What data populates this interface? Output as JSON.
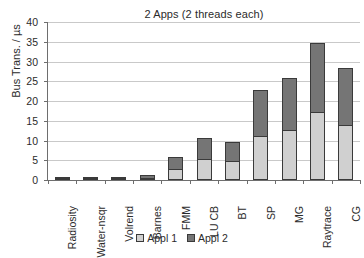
{
  "chart_data": {
    "type": "bar",
    "stacked": true,
    "title": "2 Apps (2 threads each)",
    "xlabel": "",
    "ylabel": "Bus Trans. / µs",
    "ylim": [
      0,
      40
    ],
    "ytick_step": 5,
    "yticks": [
      0,
      5,
      10,
      15,
      20,
      25,
      30,
      35,
      40
    ],
    "ytick_labels": [
      "0",
      "5",
      "10",
      "15",
      "20",
      "25",
      "30",
      "35",
      "40"
    ],
    "grid": true,
    "legend_position": "bottom",
    "categories": [
      "Radiosity",
      "Water-nsqr",
      "Volrend",
      "Barnes",
      "FMM",
      "LU CB",
      "BT",
      "SP",
      "MG",
      "Raytrace",
      "CG"
    ],
    "series": [
      {
        "name": "Appl 1",
        "color": "#d0d0d0",
        "values": [
          0.35,
          0.3,
          0.35,
          0.6,
          2.7,
          5.4,
          4.7,
          11.2,
          12.6,
          17.3,
          14.0
        ]
      },
      {
        "name": "Appl 2",
        "color": "#757575",
        "values": [
          0.35,
          0.3,
          0.35,
          0.6,
          3.1,
          5.3,
          5.0,
          11.7,
          13.3,
          17.4,
          14.3
        ]
      }
    ],
    "totals": [
      0.7,
      0.6,
      0.7,
      1.2,
      5.8,
      10.7,
      9.7,
      22.9,
      25.9,
      34.7,
      28.3
    ]
  },
  "legend": {
    "entries": [
      {
        "label": "Appl 1"
      },
      {
        "label": "Appl 2"
      }
    ]
  },
  "colors": {
    "appl1": "#d0d0d0",
    "appl2": "#757575",
    "axis": "#6e6e6e",
    "grid": "#c9c9c9",
    "bar_outline": "#3a3a3a",
    "text": "#2b2b2b",
    "background": "#ffffff"
  }
}
